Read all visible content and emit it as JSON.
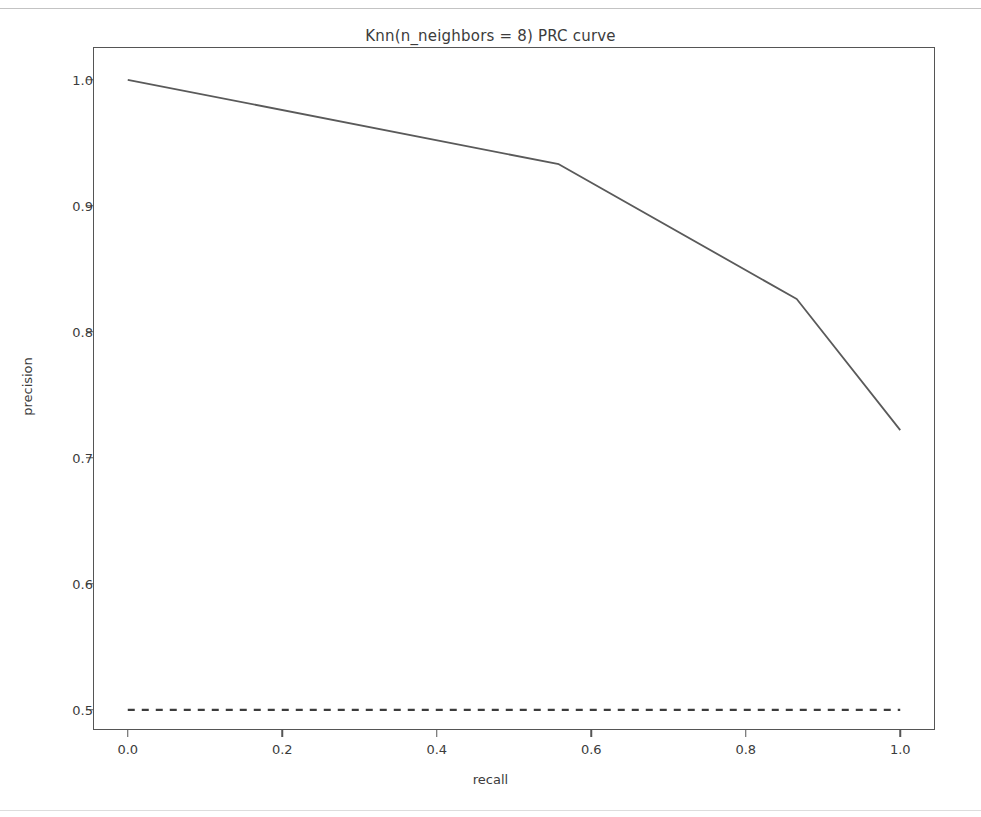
{
  "chart_data": {
    "type": "line",
    "title": "Knn(n_neighbors = 8) PRC curve",
    "xlabel": "recall",
    "ylabel": "precision",
    "xlim": [
      -0.045,
      1.045
    ],
    "ylim": [
      0.484,
      1.026
    ],
    "grid": false,
    "legend": null,
    "xticks": [
      {
        "value": 0.0,
        "label": "0.0"
      },
      {
        "value": 0.2,
        "label": "0.2"
      },
      {
        "value": 0.4,
        "label": "0.4"
      },
      {
        "value": 0.6,
        "label": "0.6"
      },
      {
        "value": 0.8,
        "label": "0.8"
      },
      {
        "value": 1.0,
        "label": "1.0"
      }
    ],
    "yticks": [
      {
        "value": 0.5,
        "label": "0.5"
      },
      {
        "value": 0.6,
        "label": "0.6"
      },
      {
        "value": 0.7,
        "label": "0.7"
      },
      {
        "value": 0.8,
        "label": "0.8"
      },
      {
        "value": 0.9,
        "label": "0.9"
      },
      {
        "value": 1.0,
        "label": "1.0"
      }
    ],
    "series": [
      {
        "name": "prc-curve",
        "style": "solid",
        "color": "#5a5a5a",
        "x": [
          0.0,
          0.558,
          0.866,
          1.0
        ],
        "y": [
          1.0,
          0.933,
          0.826,
          0.722
        ]
      },
      {
        "name": "baseline",
        "style": "dashed",
        "color": "#3c3c3c",
        "x": [
          0.0,
          1.0
        ],
        "y": [
          0.5,
          0.5
        ]
      }
    ]
  }
}
